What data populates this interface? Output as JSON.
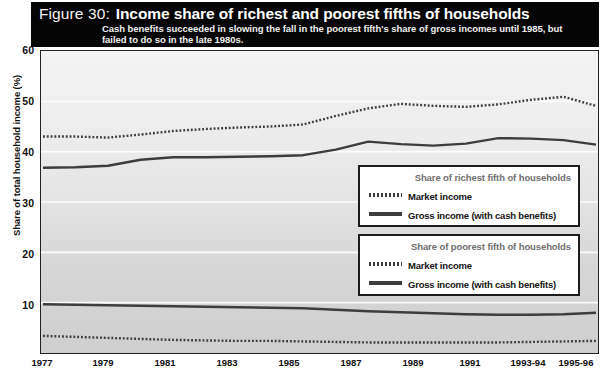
{
  "figure": {
    "number_label": "Figure 30:",
    "title": "Income share of richest and poorest fifths of households",
    "subtitle": "Cash benefits succeeded in slowing the fall in the poorest fifth's share of gross incomes until 1985, but failed to do so in the late 1980s."
  },
  "legends": {
    "richest": {
      "title": "Share of richest fifth of households",
      "market": "Market income",
      "gross": "Gross income (with cash benefits)"
    },
    "poorest": {
      "title": "Share of poorest fifth of households",
      "market": "Market income",
      "gross": "Gross income (with cash benefits)"
    }
  },
  "colors": {
    "banner_bg": "#050505",
    "line": "#3d3d3d",
    "plot_bg_top": "#f4f4f4",
    "plot_bg_bottom": "#cfcfcf",
    "frame": "#222222"
  },
  "chart_data": {
    "type": "line",
    "title": "Income share of richest and poorest fifths of households",
    "subtitle": "Cash benefits succeeded in slowing the fall in the poorest fifth's share of gross incomes until 1985, but failed to do so in the late 1980s.",
    "xlabel": "",
    "ylabel": "Share of total household income (%)",
    "ylim": [
      0,
      60
    ],
    "yticks": [
      10,
      20,
      30,
      40,
      50,
      60
    ],
    "grid": true,
    "legend_position": "inside-right",
    "x": [
      "1977",
      "1978",
      "1979",
      "1980",
      "1981",
      "1982",
      "1983",
      "1984",
      "1985",
      "1986",
      "1987",
      "1988",
      "1989",
      "1990",
      "1991",
      "1992",
      "1993-94",
      "1995-96"
    ],
    "xticklabels": [
      "1977",
      "1979",
      "1981",
      "1983",
      "1985",
      "1987",
      "1989",
      "1991",
      "1993-94",
      "1995-96"
    ],
    "series": [
      {
        "name": "Richest fifth - Market income",
        "group": "richest",
        "style": "dotted",
        "values": [
          43.0,
          43.0,
          42.8,
          43.4,
          44.1,
          44.5,
          44.8,
          45.0,
          45.4,
          47.1,
          48.6,
          49.5,
          49.1,
          48.9,
          49.4,
          50.3,
          50.9,
          49.1
        ]
      },
      {
        "name": "Richest fifth - Gross income (with cash benefits)",
        "group": "richest",
        "style": "solid",
        "values": [
          36.8,
          36.9,
          37.2,
          38.4,
          38.9,
          38.9,
          39.0,
          39.1,
          39.3,
          40.4,
          42.0,
          41.5,
          41.2,
          41.6,
          42.7,
          42.6,
          42.3,
          41.4
        ]
      },
      {
        "name": "Poorest fifth - Market income",
        "group": "poorest",
        "style": "dotted",
        "values": [
          3.4,
          3.2,
          3.0,
          2.8,
          2.6,
          2.5,
          2.4,
          2.4,
          2.3,
          2.2,
          2.1,
          2.1,
          2.1,
          2.1,
          2.1,
          2.2,
          2.3,
          2.4
        ]
      },
      {
        "name": "Poorest fifth - Gross income (with cash benefits)",
        "group": "poorest",
        "style": "solid",
        "values": [
          9.7,
          9.6,
          9.5,
          9.4,
          9.3,
          9.2,
          9.1,
          9.0,
          8.9,
          8.6,
          8.3,
          8.1,
          7.9,
          7.7,
          7.6,
          7.6,
          7.7,
          8.0
        ]
      }
    ]
  }
}
